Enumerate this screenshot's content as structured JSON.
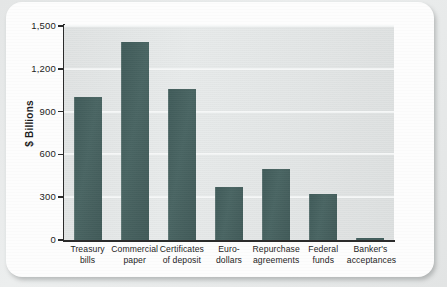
{
  "chart_data": {
    "type": "bar",
    "title": "",
    "xlabel": "",
    "ylabel": "$ Billions",
    "ylim": [
      0,
      1500
    ],
    "yticks": [
      0,
      300,
      600,
      900,
      1200,
      1500
    ],
    "ytick_labels": [
      "0",
      "300",
      "600",
      "900",
      "1,200",
      "1,500"
    ],
    "grid": true,
    "legend": "none",
    "categories": [
      "Treasury bills",
      "Commercial paper",
      "Certificates of deposit",
      "Euro-dollars",
      "Repurchase agreements",
      "Federal funds",
      "Banker's acceptances"
    ],
    "category_lines": [
      [
        "Treasury",
        "bills"
      ],
      [
        "Commercial",
        "paper"
      ],
      [
        "Certificates",
        "of deposit"
      ],
      [
        "Euro-",
        "dollars"
      ],
      [
        "Repurchase",
        "agreements"
      ],
      [
        "Federal",
        "funds"
      ],
      [
        "Banker's",
        "acceptances"
      ]
    ],
    "values": [
      1000,
      1390,
      1060,
      375,
      500,
      320,
      12
    ],
    "bar_color": "#3d5a58",
    "plot_background": "#e3e6e6",
    "gridline_color": "#f6f8f8",
    "axis_color": "#2b2b2b"
  }
}
